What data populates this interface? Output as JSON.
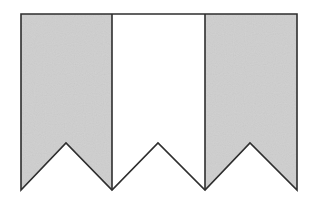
{
  "diagram": {
    "canvas": {
      "width": 321,
      "height": 206,
      "background": "#ffffff"
    },
    "stroke_color": "#2e2e2e",
    "stroke_width": 1.6,
    "top_y": 14,
    "notch_peak_y": 143,
    "bottom_y": 190,
    "strips": [
      {
        "id": "left",
        "x0": 21,
        "x1": 112,
        "peak_x": 66,
        "fill": "#cfcfcf",
        "shaded": true
      },
      {
        "id": "middle",
        "x0": 112,
        "x1": 205,
        "peak_x": 158,
        "fill": "#ffffff",
        "shaded": false
      },
      {
        "id": "right",
        "x0": 205,
        "x1": 297,
        "peak_x": 250,
        "fill": "#cfcfcf",
        "shaded": true
      }
    ]
  }
}
